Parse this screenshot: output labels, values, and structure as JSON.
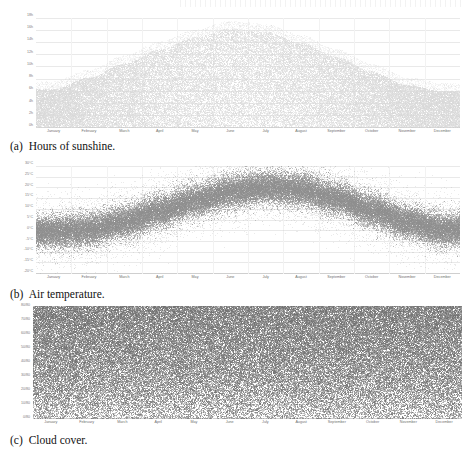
{
  "figure": {
    "kind": "multi-panel-scatter-figure",
    "panel_count": 3,
    "months": [
      "January",
      "February",
      "March",
      "April",
      "May",
      "June",
      "July",
      "August",
      "September",
      "October",
      "November",
      "December"
    ],
    "dot_color_light": "#d8d8d8",
    "dot_color_mid": "#8e8e8e",
    "dot_color_dark": "#6f6f6f",
    "gridline_color": "#e9e9e9",
    "axis_color": "#cfcfcf",
    "tick_label_color": "#7a7a7a"
  },
  "panel_a": {
    "caption_tag": "(a)",
    "caption_text": "Hours of sunshine.",
    "y_ticks": [
      "18h",
      "16h",
      "14h",
      "12h",
      "10h",
      "8h",
      "6h",
      "4h",
      "2h",
      "0h"
    ],
    "y_tick_values": [
      18,
      16,
      14,
      12,
      10,
      8,
      6,
      4,
      2,
      0
    ],
    "x_ticks": [
      "January",
      "February",
      "March",
      "April",
      "May",
      "June",
      "July",
      "August",
      "September",
      "October",
      "November",
      "December"
    ]
  },
  "panel_b": {
    "caption_tag": "(b)",
    "caption_text": "Air temperature.",
    "y_ticks": [
      "30°C",
      "25°C",
      "20°C",
      "15°C",
      "10°C",
      "5°C",
      "0°C",
      "-5°C",
      "-10°C",
      "-15°C",
      "-20°C"
    ],
    "y_tick_values": [
      30,
      25,
      20,
      15,
      10,
      5,
      0,
      -5,
      -10,
      -15,
      -20
    ],
    "x_ticks": [
      "January",
      "February",
      "March",
      "April",
      "May",
      "June",
      "July",
      "August",
      "September",
      "October",
      "November",
      "December"
    ]
  },
  "panel_c": {
    "caption_tag": "(c)",
    "caption_text": "Cloud cover.",
    "y_ticks": [
      "80/80",
      "70/80",
      "60/80",
      "50/80",
      "40/80",
      "30/80",
      "20/80",
      "10/80",
      "0/80"
    ],
    "y_tick_values": [
      80,
      70,
      60,
      50,
      40,
      30,
      20,
      10,
      0
    ],
    "x_ticks": [
      "January",
      "February",
      "March",
      "April",
      "May",
      "June",
      "July",
      "August",
      "September",
      "October",
      "November",
      "December"
    ]
  },
  "chart_data": [
    {
      "id": "panel_a",
      "type": "scatter",
      "title": "Hours of sunshine.",
      "xlabel": "",
      "ylabel": "Hours of sunshine",
      "xlim": [
        0,
        12
      ],
      "ylim": [
        0,
        18
      ],
      "grid": true,
      "legend": "none",
      "x_tick_labels": [
        "January",
        "February",
        "March",
        "April",
        "May",
        "June",
        "July",
        "August",
        "September",
        "October",
        "November",
        "December"
      ],
      "y_tick_labels": [
        "0h",
        "2h",
        "4h",
        "6h",
        "8h",
        "10h",
        "12h",
        "14h",
        "16h",
        "18h"
      ],
      "description": "Dense light-grey point cloud of daily sunshine hours across a year; envelope rises from about 6h maximum in January to about 16h in late June, then falls symmetrically back to about 6h in December. Points fill the region from 0h up to the seasonal envelope, so the cloud is a filled bell shape resting on the 0h axis.",
      "monthly_envelope_max_hours": [
        6.3,
        8.2,
        10.5,
        12.8,
        14.8,
        16.2,
        15.7,
        13.9,
        11.6,
        9.2,
        7.0,
        6.0
      ],
      "monthly_mean_hours": [
        2.5,
        3.4,
        4.6,
        5.8,
        6.9,
        7.6,
        7.3,
        6.3,
        5.0,
        3.8,
        2.8,
        2.3
      ],
      "monthly_min_hours": [
        0,
        0,
        0,
        0,
        0,
        0,
        0,
        0,
        0,
        0,
        0,
        0
      ],
      "series": [
        {
          "name": "Daily sunshine hours",
          "categories": [
            "January",
            "February",
            "March",
            "April",
            "May",
            "June",
            "July",
            "August",
            "September",
            "October",
            "November",
            "December"
          ],
          "values": [
            2.5,
            3.4,
            4.6,
            5.8,
            6.9,
            7.6,
            7.3,
            6.3,
            5.0,
            3.8,
            2.8,
            2.3
          ]
        }
      ],
      "point_color": "#d8d8d8",
      "point_count_approx": 9000
    },
    {
      "id": "panel_b",
      "type": "scatter",
      "title": "Air temperature.",
      "xlabel": "",
      "ylabel": "Air temperature",
      "xlim": [
        0,
        12
      ],
      "ylim": [
        -20,
        30
      ],
      "grid": true,
      "legend": "none",
      "x_tick_labels": [
        "January",
        "February",
        "March",
        "April",
        "May",
        "June",
        "July",
        "August",
        "September",
        "October",
        "November",
        "December"
      ],
      "y_tick_labels": [
        "-20°C",
        "-15°C",
        "-10°C",
        "-5°C",
        "0°C",
        "5°C",
        "10°C",
        "15°C",
        "20°C",
        "25°C",
        "30°C"
      ],
      "description": "Mid-grey point cloud forming a broad seasonal band of hourly air temperature. Band centre rises from roughly 0°C in January to roughly 20°C in July, then declines back toward 0°C in December. Band half-width is about 6°C, with sparse outliers reaching near 30°C in summer and near -18°C in winter.",
      "monthly_mean_temp_c": [
        -0.5,
        0.5,
        4.0,
        9.0,
        14.0,
        18.0,
        20.0,
        19.0,
        15.0,
        9.5,
        4.0,
        0.5
      ],
      "monthly_max_temp_c": [
        9,
        11,
        16,
        22,
        26,
        29,
        30,
        29,
        25,
        19,
        13,
        10
      ],
      "monthly_min_temp_c": [
        -14,
        -13,
        -9,
        -4,
        1,
        6,
        9,
        8,
        3,
        -3,
        -8,
        -13
      ],
      "series": [
        {
          "name": "Air temperature",
          "categories": [
            "January",
            "February",
            "March",
            "April",
            "May",
            "June",
            "July",
            "August",
            "September",
            "October",
            "November",
            "December"
          ],
          "values": [
            -0.5,
            0.5,
            4.0,
            9.0,
            14.0,
            18.0,
            20.0,
            19.0,
            15.0,
            9.5,
            4.0,
            0.5
          ]
        }
      ],
      "point_color": "#8e8e8e",
      "point_count_approx": 12000
    },
    {
      "id": "panel_c",
      "type": "scatter",
      "title": "Cloud cover.",
      "xlabel": "",
      "ylabel": "Cloud cover (octas of 80)",
      "xlim": [
        0,
        12
      ],
      "ylim": [
        0,
        80
      ],
      "grid": true,
      "legend": "none",
      "x_tick_labels": [
        "January",
        "February",
        "March",
        "April",
        "May",
        "June",
        "July",
        "August",
        "September",
        "October",
        "November",
        "December"
      ],
      "y_tick_labels": [
        "0/80",
        "10/80",
        "20/80",
        "30/80",
        "40/80",
        "50/80",
        "60/80",
        "70/80",
        "80/80"
      ],
      "description": "Near-uniform dark noise of cloud-cover observations covering the whole plot area with no clear seasonal trend. Density is highest near the top (fully overcast, 80/80) and gradually thins toward the bottom (clear sky, 0/80).",
      "monthly_mean_cover_of_80": [
        56,
        54,
        52,
        50,
        48,
        46,
        45,
        46,
        49,
        54,
        57,
        58
      ],
      "density_profile_top_to_bottom": [
        1.0,
        0.92,
        0.85,
        0.78,
        0.7,
        0.62,
        0.52,
        0.4,
        0.26
      ],
      "series": [
        {
          "name": "Cloud cover",
          "categories": [
            "January",
            "February",
            "March",
            "April",
            "May",
            "June",
            "July",
            "August",
            "September",
            "October",
            "November",
            "December"
          ],
          "values": [
            56,
            54,
            52,
            50,
            48,
            46,
            45,
            46,
            49,
            54,
            57,
            58
          ]
        }
      ],
      "point_color": "#6f6f6f",
      "point_count_approx": 16000
    }
  ]
}
